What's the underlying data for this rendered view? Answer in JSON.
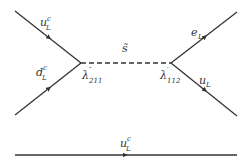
{
  "diagram": {
    "type": "feynman-diagram",
    "colors": {
      "line": "#333333",
      "background": "#ffffff"
    },
    "particles": {
      "top_left": {
        "symbol": "u",
        "sup": "c",
        "sub": "L"
      },
      "bottom_left": {
        "symbol": "d",
        "sup": "c",
        "sub": "L"
      },
      "propagator": {
        "symbol": "s̃"
      },
      "top_right": {
        "symbol": "e",
        "sub": "L"
      },
      "bottom_right": {
        "symbol": "u",
        "sub": "L"
      },
      "spectator": {
        "symbol": "u",
        "sup": "c",
        "sub": "L"
      }
    },
    "vertices": {
      "left": {
        "symbol": "λ",
        "prime": "″",
        "sub": "211"
      },
      "right": {
        "symbol": "λ",
        "prime": "′",
        "sub": "112"
      }
    }
  }
}
